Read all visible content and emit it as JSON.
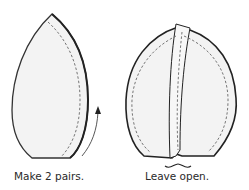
{
  "diagram": {
    "left_figure": {
      "caption": "Make 2 pairs.",
      "fill_color": "#f2f2f2",
      "outline_color": "#222222",
      "has_stitch_line": true,
      "has_direction_arrow": true
    },
    "right_figure": {
      "caption": "Leave open.",
      "fill_color": "#f2f2f2",
      "outline_color": "#222222",
      "has_stitch_line": true,
      "has_opening_brace": true
    }
  }
}
